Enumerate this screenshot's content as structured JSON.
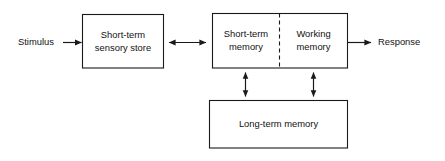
{
  "diagram": {
    "background_color": "#ffffff",
    "stroke_color": "#1a1a1a",
    "text_color": "#111111",
    "boxes": {
      "sensory_store": {
        "label_line1": "Short-term",
        "label_line2": "sensory store"
      },
      "short_term_memory": {
        "label_line1": "Short-term",
        "label_line2": "memory"
      },
      "working_memory": {
        "label_line1": "Working",
        "label_line2": "memory"
      },
      "long_term_memory": {
        "label_line1": "Long-term memory"
      }
    },
    "endpoints": {
      "stimulus": "Stimulus",
      "response": "Response"
    },
    "connectors": {
      "stimulus_to_sensory": "single-arrow-right",
      "sensory_to_memory": "double-arrow-horizontal",
      "memory_to_response": "single-arrow-right",
      "stm_to_ltm": "double-arrow-vertical",
      "wm_to_ltm": "double-arrow-vertical"
    }
  }
}
